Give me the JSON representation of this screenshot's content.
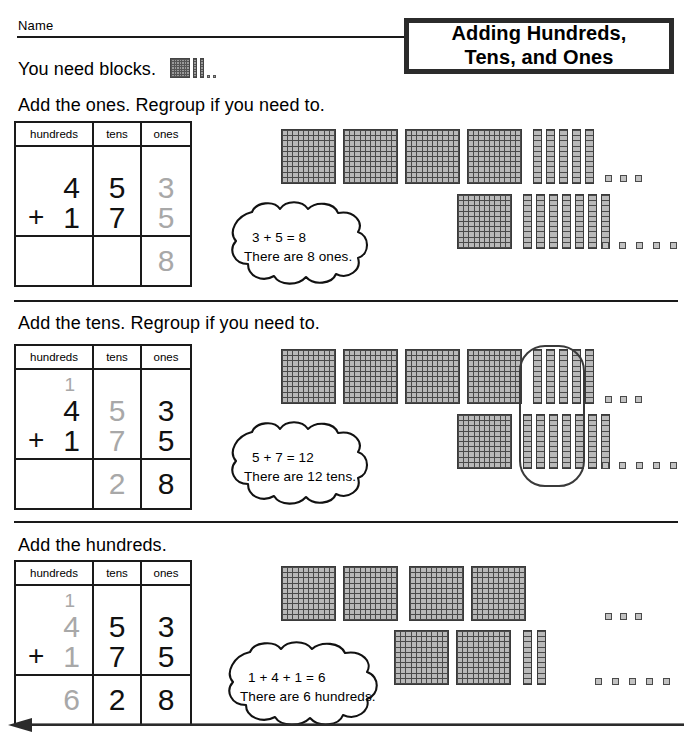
{
  "worksheet": {
    "name_label": "Name",
    "title": "Adding Hundreds, Tens, and Ones",
    "title_line1": "Adding Hundreds,",
    "title_line2": "Tens, and Ones",
    "materials_text": "You need blocks.",
    "materials_icons": [
      "hundred-flat",
      "ten-rod",
      "ten-rod",
      "one-cube",
      "one-cube"
    ]
  },
  "colors": {
    "ink": "#1a1a1a",
    "highlight_digit": "#a8a8a8",
    "active_digit": "#111111",
    "block_fill": "#b9b9b9",
    "block_line": "#4a4a4a"
  },
  "table_headers": [
    "hundreds",
    "tens",
    "ones"
  ],
  "problem": {
    "addend_1": 453,
    "addend_2": 175,
    "sum": 628,
    "operator": "+"
  },
  "sections": [
    {
      "id": "ones",
      "heading": "Add the ones. Regroup if you need to.",
      "table": {
        "carry": "",
        "carry_active": false,
        "top_row": {
          "hundreds": "4",
          "tens": "5",
          "ones": "3"
        },
        "bottom_row": {
          "operator": "+",
          "hundreds": "1",
          "tens": "7",
          "ones": "5"
        },
        "sum_row": {
          "hundreds": "",
          "tens": "",
          "ones": "8"
        },
        "active_column": "ones"
      },
      "cloud": {
        "equation": "3 + 5 = 8",
        "statement": "There are 8 ones."
      },
      "blocks": {
        "row_top": {
          "flats": 4,
          "rods": 5,
          "cubes": 3
        },
        "row_bottom": {
          "flats": 1,
          "rods": 7,
          "cubes": 5
        },
        "lasso": false
      }
    },
    {
      "id": "tens",
      "heading": "Add the tens. Regroup if you need to.",
      "table": {
        "carry": "1",
        "carry_active": false,
        "top_row": {
          "hundreds": "4",
          "tens": "5",
          "ones": "3"
        },
        "bottom_row": {
          "operator": "+",
          "hundreds": "1",
          "tens": "7",
          "ones": "5"
        },
        "sum_row": {
          "hundreds": "",
          "tens": "2",
          "ones": "8"
        },
        "active_column": "tens"
      },
      "cloud": {
        "equation": "5 + 7 = 12",
        "statement": "There are 12 tens."
      },
      "blocks": {
        "row_top": {
          "flats": 4,
          "rods": 5,
          "cubes": 3
        },
        "row_bottom": {
          "flats": 1,
          "rods": 7,
          "cubes": 5
        },
        "lasso": true,
        "lasso_label": "regroup-ten-tens"
      }
    },
    {
      "id": "hundreds",
      "heading": "Add the hundreds.",
      "table": {
        "carry": "1",
        "carry_active": true,
        "top_row": {
          "hundreds": "4",
          "tens": "5",
          "ones": "3"
        },
        "bottom_row": {
          "operator": "+",
          "hundreds": "1",
          "tens": "7",
          "ones": "5"
        },
        "sum_row": {
          "hundreds": "6",
          "tens": "2",
          "ones": "8"
        },
        "active_column": "hundreds"
      },
      "cloud": {
        "equation": "1 + 4 + 1 = 6",
        "statement": "There are 6 hundreds."
      },
      "blocks": {
        "row_top": {
          "flats": 4,
          "rods": 0,
          "cubes": 3
        },
        "row_bottom": {
          "flats": 2,
          "rods": 2,
          "cubes": 5
        },
        "lasso": false
      }
    }
  ]
}
